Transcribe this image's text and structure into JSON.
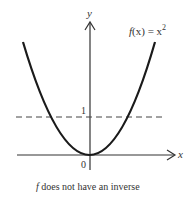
{
  "figure": {
    "y_axis_label": "y",
    "x_axis_label": "x",
    "function_label_f": "f",
    "function_label_rest": "(x) = x",
    "function_exponent": "2",
    "tick_one": "1",
    "origin_label": "0",
    "caption_f": "f",
    "caption_rest": " does not have an inverse",
    "colors": {
      "curve": "#1a1a1a",
      "axis": "#333333",
      "dashed": "#444444"
    }
  }
}
